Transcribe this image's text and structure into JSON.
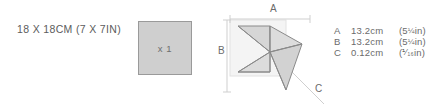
{
  "paper": {
    "size_label": "18 X 18CM (7 X 7IN)",
    "quantity_label": "x 1",
    "swatch_fill": "#cfcfcf",
    "swatch_border": "#9a9a9a"
  },
  "diagram": {
    "name": "pinwheel-star-model",
    "dimension_letters": {
      "a": "A",
      "b": "B",
      "c": "C"
    },
    "model_fill": "#d6d6d6",
    "model_stroke": "#8a8a8a",
    "guide_stroke": "#cccccc"
  },
  "measurements": {
    "rows": [
      {
        "key": "A",
        "metric": "13.2cm",
        "imperial_prefix": "(5",
        "imperial_fraction": "¼",
        "imperial_suffix": "in)"
      },
      {
        "key": "B",
        "metric": "13.2cm",
        "imperial_prefix": "(5",
        "imperial_fraction": "¼",
        "imperial_suffix": "in)"
      },
      {
        "key": "C",
        "metric": "0.12cm",
        "imperial_prefix": "(",
        "imperial_fraction": "⅟₁₆",
        "imperial_suffix": "in)"
      }
    ]
  }
}
